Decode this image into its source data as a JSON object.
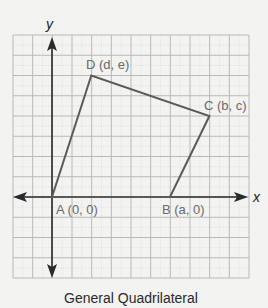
{
  "figure": {
    "caption": "General Quadrilateral",
    "background": "#f3f3f1",
    "grid": {
      "left": 13,
      "top": 35,
      "right": 249,
      "bottom": 278,
      "cols": 12,
      "rows": 12,
      "color": "#b9b9b9"
    },
    "origin_px": {
      "x": 52,
      "y": 197
    },
    "unit_px": {
      "x": 19.67,
      "y": 20.25
    },
    "axes": {
      "x_label": "x",
      "y_label": "y",
      "color": "#2a2a2a"
    },
    "quadrilateral": {
      "stroke": "#5a5a5a",
      "vertices": [
        {
          "name": "A",
          "label": "A (0, 0)",
          "var": "(0, 0)",
          "grid": [
            0,
            0
          ]
        },
        {
          "name": "B",
          "label": "B (a, 0)",
          "var": "(a, 0)",
          "grid": [
            6,
            0
          ]
        },
        {
          "name": "C",
          "label": "C (b, c)",
          "var": "(b, c)",
          "grid": [
            8,
            4
          ]
        },
        {
          "name": "D",
          "label": "D (d, e)",
          "var": "(d, e)",
          "grid": [
            2,
            6
          ]
        }
      ]
    }
  }
}
